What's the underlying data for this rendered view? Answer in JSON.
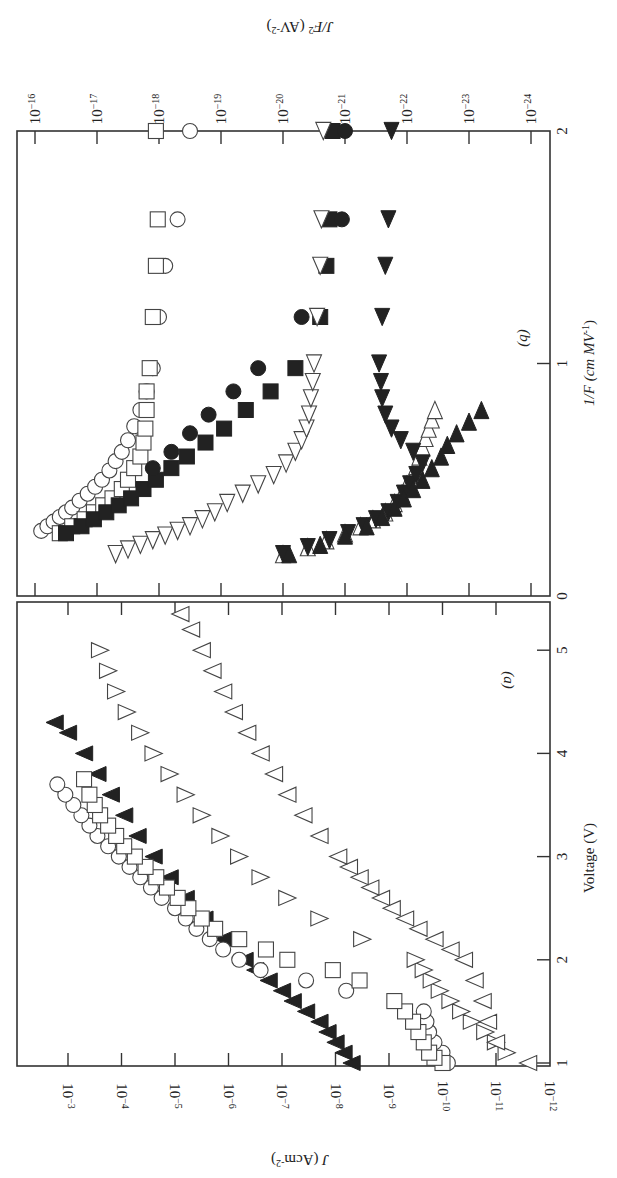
{
  "figure": {
    "orientation": "rotated 90 degrees clockwise",
    "panels": [
      "(a)",
      "(b)"
    ]
  },
  "chart_data": [
    {
      "panel": "(a)",
      "type": "scatter",
      "title": "",
      "panel_label": "(a)",
      "xlabel": "Voltage (V)",
      "ylabel": "J (A cm^-2)",
      "xlabel_display": "Voltage (V)",
      "ylabel_display": "J (Acm",
      "ylabel_sup": "-2",
      "ylabel_close": ")",
      "xlim": [
        1,
        5.3
      ],
      "x_ticks": [
        "1",
        "2",
        "3",
        "4",
        "5"
      ],
      "ylim_log10": [
        -12,
        -3
      ],
      "y_tick_exponents": [
        "-3",
        "-4",
        "-5",
        "-6",
        "-7",
        "-8",
        "-9",
        "-10",
        "-11",
        "-12"
      ],
      "y_tick_base": "10",
      "yscale": "log",
      "grid": false,
      "legend": "none",
      "series": [
        {
          "name": "filled up-triangle",
          "marker": "tri-fill",
          "x": [
            1.0,
            1.1,
            1.2,
            1.3,
            1.4,
            1.5,
            1.6,
            1.7,
            1.8,
            1.9,
            2.0,
            2.2,
            2.4,
            2.6,
            2.8,
            3.0,
            3.2,
            3.4,
            3.6,
            3.8,
            4.0,
            4.2,
            4.3
          ],
          "log10_y": [
            -8.3,
            -8.15,
            -8.0,
            -7.85,
            -7.7,
            -7.45,
            -7.2,
            -7.0,
            -6.75,
            -6.5,
            -6.3,
            -5.9,
            -5.55,
            -5.2,
            -4.9,
            -4.6,
            -4.3,
            -4.05,
            -3.8,
            -3.55,
            -3.3,
            -3.0,
            -2.75
          ]
        },
        {
          "name": "open circle",
          "marker": "circle",
          "x": [
            1.0,
            1.1,
            1.2,
            1.3,
            1.4,
            1.5,
            1.7,
            1.8,
            1.9,
            2.0,
            2.1,
            2.2,
            2.3,
            2.4,
            2.5,
            2.6,
            2.7,
            2.8,
            2.9,
            3.0,
            3.1,
            3.2,
            3.3,
            3.4,
            3.5,
            3.6,
            3.7
          ],
          "log10_y": [
            -10.1,
            -10.0,
            -9.85,
            -9.75,
            -9.7,
            -9.65,
            -8.2,
            -7.45,
            -6.6,
            -6.2,
            -5.9,
            -5.65,
            -5.4,
            -5.2,
            -5.0,
            -4.75,
            -4.55,
            -4.35,
            -4.15,
            -3.95,
            -3.75,
            -3.55,
            -3.4,
            -3.25,
            -3.1,
            -2.95,
            -2.8
          ]
        },
        {
          "name": "open square",
          "marker": "square",
          "x": [
            1.0,
            1.05,
            1.1,
            1.2,
            1.3,
            1.4,
            1.5,
            1.6,
            1.8,
            1.9,
            2.0,
            2.1,
            2.2,
            2.3,
            2.4,
            2.5,
            2.6,
            2.7,
            2.8,
            2.9,
            3.0,
            3.1,
            3.2,
            3.3,
            3.4,
            3.5,
            3.6,
            3.75
          ],
          "log10_y": [
            -10.0,
            -9.85,
            -9.75,
            -9.65,
            -9.55,
            -9.45,
            -9.3,
            -9.1,
            -8.45,
            -7.95,
            -7.1,
            -6.7,
            -6.2,
            -5.75,
            -5.5,
            -5.25,
            -5.05,
            -4.85,
            -4.65,
            -4.45,
            -4.25,
            -4.05,
            -3.9,
            -3.75,
            -3.6,
            -3.5,
            -3.4,
            -3.3
          ]
        },
        {
          "name": "open down-triangle",
          "marker": "tri-down",
          "x": [
            1.1,
            1.2,
            1.3,
            1.4,
            1.5,
            1.6,
            1.7,
            1.8,
            1.9,
            2.0,
            2.2,
            2.4,
            2.6,
            2.8,
            3.0,
            3.2,
            3.4,
            3.6,
            3.8,
            4.0,
            4.2,
            4.4,
            4.6,
            4.8,
            5.0
          ],
          "log10_y": [
            -11.2,
            -11.0,
            -10.8,
            -10.55,
            -10.35,
            -10.15,
            -9.95,
            -9.8,
            -9.65,
            -9.5,
            -8.5,
            -7.7,
            -7.1,
            -6.6,
            -6.2,
            -5.85,
            -5.5,
            -5.2,
            -4.9,
            -4.6,
            -4.35,
            -4.1,
            -3.9,
            -3.75,
            -3.6
          ]
        },
        {
          "name": "open up-triangle",
          "marker": "tri-up",
          "x": [
            1.0,
            1.2,
            1.4,
            1.6,
            1.8,
            2.0,
            2.1,
            2.2,
            2.3,
            2.4,
            2.5,
            2.6,
            2.7,
            2.8,
            2.9,
            3.0,
            3.2,
            3.4,
            3.6,
            3.8,
            4.0,
            4.2,
            4.4,
            4.6,
            4.8,
            5.0,
            5.2,
            5.35
          ],
          "log10_y": [
            -11.6,
            -11.0,
            -10.85,
            -10.75,
            -10.6,
            -10.4,
            -10.15,
            -9.85,
            -9.55,
            -9.3,
            -9.05,
            -8.85,
            -8.65,
            -8.45,
            -8.25,
            -8.05,
            -7.7,
            -7.4,
            -7.1,
            -6.85,
            -6.6,
            -6.35,
            -6.1,
            -5.9,
            -5.7,
            -5.5,
            -5.3,
            -5.1
          ]
        }
      ]
    },
    {
      "panel": "(b)",
      "type": "scatter",
      "title": "",
      "panel_label": "(b)",
      "xlabel": "1/F (cm MV^-1)",
      "ylabel": "J/F^2 (A V^-2)",
      "xlabel_display": "1/F (cm MV",
      "xlabel_sup": "-1",
      "xlabel_close": ")",
      "ylabel_display": "J/F",
      "ylabel_sup": "2",
      "ylabel_rest": " (AV",
      "ylabel_sup2": "-2",
      "ylabel_close": ")",
      "xlim": [
        0,
        2
      ],
      "x_ticks": [
        "0",
        "1",
        "2"
      ],
      "ylim_log10": [
        -24,
        -16
      ],
      "y_tick_exponents": [
        "-16",
        "-17",
        "-18",
        "-19",
        "-20",
        "-21",
        "-22",
        "-23",
        "-24"
      ],
      "y_tick_base": "10",
      "yscale": "log",
      "grid": false,
      "legend": "none",
      "series": [
        {
          "name": "open circle",
          "marker": "circle",
          "x": [
            0.28,
            0.3,
            0.32,
            0.34,
            0.36,
            0.38,
            0.41,
            0.44,
            0.47,
            0.5,
            0.54,
            0.58,
            0.62,
            0.67,
            0.73,
            0.8,
            0.88,
            0.98,
            1.2,
            1.42,
            1.62,
            2.0
          ],
          "log10_y": [
            -16.1,
            -16.2,
            -16.3,
            -16.4,
            -16.5,
            -16.6,
            -16.72,
            -16.85,
            -16.97,
            -17.08,
            -17.2,
            -17.3,
            -17.4,
            -17.5,
            -17.6,
            -17.7,
            -17.8,
            -17.9,
            -18.0,
            -18.1,
            -18.3,
            -18.5
          ]
        },
        {
          "name": "open square",
          "marker": "square",
          "x": [
            0.27,
            0.3,
            0.33,
            0.36,
            0.39,
            0.42,
            0.46,
            0.5,
            0.55,
            0.6,
            0.66,
            0.72,
            0.8,
            0.88,
            0.98,
            1.2,
            1.42,
            1.62,
            2.0
          ],
          "log10_y": [
            -16.4,
            -16.6,
            -16.8,
            -16.95,
            -17.1,
            -17.25,
            -17.4,
            -17.5,
            -17.6,
            -17.7,
            -17.75,
            -17.78,
            -17.8,
            -17.8,
            -17.85,
            -17.9,
            -17.95,
            -17.98,
            -17.95
          ]
        },
        {
          "name": "filled square",
          "marker": "square-fill",
          "x": [
            0.27,
            0.3,
            0.33,
            0.36,
            0.39,
            0.42,
            0.46,
            0.5,
            0.55,
            0.6,
            0.66,
            0.72,
            0.8,
            0.88,
            0.98,
            1.2,
            1.42,
            1.62,
            2.0
          ],
          "log10_y": [
            -16.5,
            -16.75,
            -16.95,
            -17.15,
            -17.35,
            -17.55,
            -17.75,
            -17.95,
            -18.2,
            -18.45,
            -18.75,
            -19.05,
            -19.4,
            -19.8,
            -20.2,
            -20.6,
            -20.7,
            -20.75,
            -20.8
          ]
        },
        {
          "name": "filled circle",
          "marker": "circle-fill",
          "x": [
            0.55,
            0.62,
            0.7,
            0.78,
            0.88,
            0.98,
            1.2,
            1.62,
            2.0
          ],
          "log10_y": [
            -17.9,
            -18.2,
            -18.5,
            -18.8,
            -19.2,
            -19.6,
            -20.3,
            -20.95,
            -21.0
          ]
        },
        {
          "name": "open left-triangle",
          "marker": "tri-left",
          "x": [
            0.18,
            0.2,
            0.22,
            0.24,
            0.26,
            0.28,
            0.3,
            0.33,
            0.36,
            0.4,
            0.44,
            0.48,
            0.52,
            0.57,
            0.62,
            0.67,
            0.72,
            0.78,
            0.85,
            0.92,
            1.0,
            1.2,
            1.42,
            1.62,
            2.0
          ],
          "log10_y": [
            -17.3,
            -17.5,
            -17.7,
            -17.9,
            -18.1,
            -18.3,
            -18.5,
            -18.7,
            -18.9,
            -19.1,
            -19.35,
            -19.6,
            -19.85,
            -20.05,
            -20.2,
            -20.3,
            -20.38,
            -20.42,
            -20.45,
            -20.48,
            -20.5,
            -20.55,
            -20.6,
            -20.62,
            -20.65
          ]
        },
        {
          "name": "open right-triangle",
          "marker": "tri-right",
          "x": [
            0.18,
            0.21,
            0.24,
            0.27,
            0.3,
            0.33,
            0.36,
            0.4,
            0.44,
            0.48,
            0.52,
            0.56,
            0.6,
            0.64,
            0.68,
            0.72,
            0.76,
            0.8
          ],
          "log10_y": [
            -20.0,
            -20.4,
            -20.7,
            -21.0,
            -21.25,
            -21.45,
            -21.65,
            -21.8,
            -21.92,
            -22.0,
            -22.1,
            -22.15,
            -22.2,
            -22.25,
            -22.3,
            -22.35,
            -22.4,
            -22.45
          ]
        },
        {
          "name": "filled left-triangle",
          "marker": "tri-left-fill",
          "x": [
            0.18,
            0.21,
            0.24,
            0.27,
            0.3,
            0.33,
            0.36,
            0.4,
            0.44,
            0.48,
            0.52,
            0.57,
            0.62,
            0.67,
            0.72,
            0.78,
            0.85,
            0.92,
            1.0,
            1.2,
            1.42,
            1.62,
            2.0
          ],
          "log10_y": [
            -20.0,
            -20.4,
            -20.75,
            -21.05,
            -21.3,
            -21.5,
            -21.7,
            -21.85,
            -21.95,
            -22.05,
            -22.15,
            -22.25,
            -22.1,
            -21.9,
            -21.75,
            -21.65,
            -21.6,
            -21.58,
            -21.55,
            -21.6,
            -21.65,
            -21.7,
            -21.75
          ]
        },
        {
          "name": "filled right-triangle",
          "marker": "tri-right-fill",
          "x": [
            0.18,
            0.22,
            0.26,
            0.3,
            0.34,
            0.38,
            0.42,
            0.46,
            0.5,
            0.55,
            0.6,
            0.65,
            0.7,
            0.75,
            0.8
          ],
          "log10_y": [
            -20.1,
            -20.6,
            -21.0,
            -21.35,
            -21.6,
            -21.8,
            -21.95,
            -22.1,
            -22.25,
            -22.4,
            -22.55,
            -22.65,
            -22.8,
            -23.0,
            -23.2
          ]
        }
      ]
    }
  ]
}
